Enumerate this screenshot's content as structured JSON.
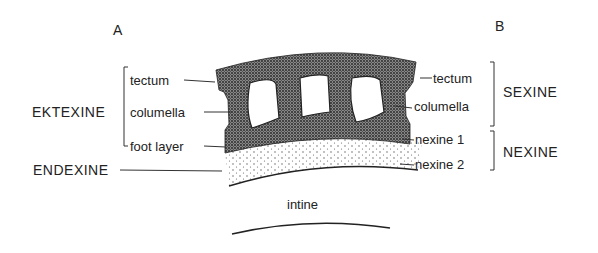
{
  "panel_labels": {
    "left": "A",
    "right": "B"
  },
  "left": {
    "group_ektexine": "EKTEXINE",
    "group_endexine": "ENDEXINE",
    "layers": [
      "tectum",
      "columella",
      "foot layer"
    ]
  },
  "right": {
    "group_sexine": "SEXINE",
    "group_nexine": "NEXINE",
    "layers": [
      "tectum",
      "columella",
      "nexine 1",
      "nexine 2"
    ]
  },
  "center": {
    "intine": "intine"
  },
  "colors": {
    "ink": "#222222",
    "stipple_dense": "#555555",
    "background": "#ffffff"
  }
}
